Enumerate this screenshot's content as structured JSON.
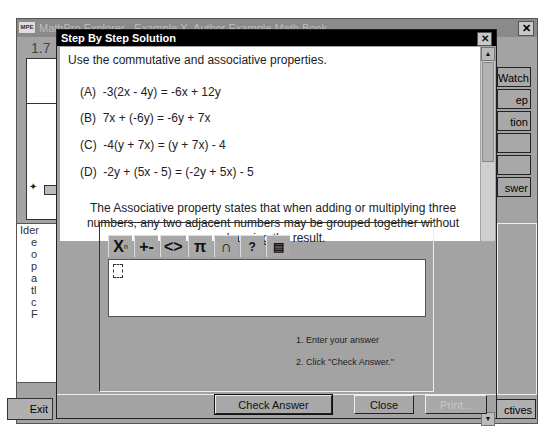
{
  "parent_window": {
    "logo": "MPE",
    "title": "MathPro Explorer - Example X, Author Example Math Book",
    "section": "1.7",
    "lower_text_fragments": [
      "Ider",
      "e",
      "o",
      "p",
      "a",
      "tl",
      "c",
      "F"
    ],
    "exit_label": "Exit",
    "side_buttons": [
      "Watch",
      "ep",
      "tion",
      "",
      "",
      "swer"
    ],
    "objectives_label": "ctives"
  },
  "dialog": {
    "title": "Step By Step Solution",
    "intro": "Use the commutative and associative properties.",
    "equations": [
      {
        "label": "(A)",
        "text": "-3(2x - 4y) = -6x + 12y"
      },
      {
        "label": "(B)",
        "text": "7x + (-6y) = -6y + 7x"
      },
      {
        "label": "(C)",
        "text": "-4(y + 7x) = (y + 7x) - 4"
      },
      {
        "label": "(D)",
        "text": "-2y + (5x - 5) = (-2y + 5x) - 5"
      }
    ],
    "explanation": "The Associative property states that when adding or multiplying three numbers, any two adjacent numbers may be grouped together without changing the result.",
    "toolbar": [
      {
        "icon": "exponent-icon",
        "glyph": "X"
      },
      {
        "icon": "plus-minus-icon",
        "glyph": "+-"
      },
      {
        "icon": "brackets-icon",
        "glyph": "<>"
      },
      {
        "icon": "pi-icon",
        "glyph": "π"
      },
      {
        "icon": "intersection-icon",
        "glyph": "∩"
      },
      {
        "icon": "help-icon",
        "glyph": "?"
      },
      {
        "icon": "calculator-icon",
        "glyph": "▤"
      }
    ],
    "instructions": [
      "1. Enter your answer",
      "2. Click \"Check Answer.\""
    ],
    "buttons": {
      "check_answer": "Check Answer",
      "close": "Close",
      "print": "Print..."
    }
  }
}
